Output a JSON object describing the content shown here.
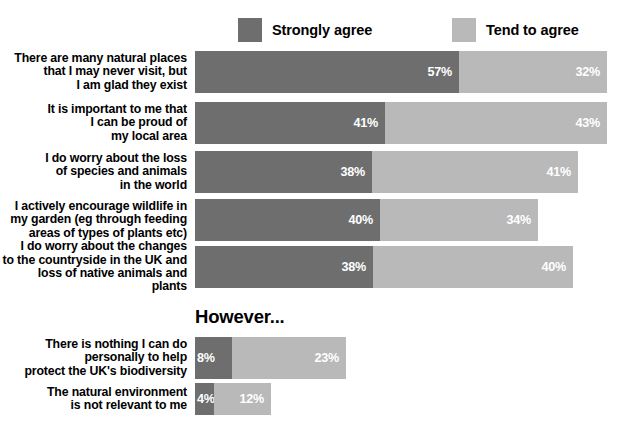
{
  "chart_data": {
    "type": "bar",
    "title": "",
    "subtitle": "",
    "xlabel": "",
    "ylabel": "",
    "orientation": "horizontal",
    "stacked": true,
    "grid": false,
    "legend_position": "top",
    "xlim": [
      0,
      100
    ],
    "unit": "%",
    "colors": {
      "strongly_agree": "#6e6e6e",
      "tend_to_agree": "#b9b9b9",
      "background": "#ffffff",
      "text": "#000000",
      "value_text": "#ffffff"
    },
    "series": [
      {
        "name": "Strongly agree",
        "values": [
          57,
          41,
          38,
          40,
          38,
          8,
          4
        ]
      },
      {
        "name": "Tend to agree",
        "values": [
          32,
          43,
          41,
          34,
          40,
          23,
          12
        ]
      }
    ],
    "categories": [
      "There are many natural places\nthat I may never visit, but\nI am glad they exist",
      "It is important to me that\nI can be proud of\nmy local area",
      "I do worry about the loss\nof species and animals\nin the world",
      "I actively encourage wildlife in\nmy garden (eg through feeding\nareas of types of plants etc)",
      "I do worry about the changes\nto the countryside in the UK and\nloss of native animals and plants",
      "There is nothing I can do\npersonally to help\nprotect the UK's biodiversity",
      "The natural environment\nis not relevant to me"
    ],
    "annotations": [
      {
        "text": "However...",
        "x": 195,
        "y": 306
      }
    ]
  },
  "legend": {
    "items": [
      {
        "label": "Strongly agree",
        "color_key": "strongly_agree",
        "swatch": "dark"
      },
      {
        "label": "Tend to agree",
        "color_key": "tend_to_agree",
        "swatch": "light"
      }
    ]
  },
  "however_heading": "However...",
  "rows": [
    {
      "label": "There are many natural places\nthat I may never visit, but\nI am glad they exist",
      "strongly": 57,
      "tend": 32,
      "strongly_value": "57%",
      "tend_value": "32%",
      "top": 51,
      "height": 42,
      "bar_left": 195,
      "dark_width": 264,
      "light_width": 148
    },
    {
      "label": "It is important to me that\nI can be proud of\nmy local area",
      "strongly": 41,
      "tend": 43,
      "strongly_value": "41%",
      "tend_value": "43%",
      "top": 102,
      "height": 42,
      "bar_left": 195,
      "dark_width": 190,
      "light_width": 222
    },
    {
      "label": "I do worry about the loss\nof species and animals\nin the world",
      "strongly": 38,
      "tend": 41,
      "strongly_value": "38%",
      "tend_value": "41%",
      "top": 151,
      "height": 42,
      "bar_left": 195,
      "dark_width": 177,
      "light_width": 206
    },
    {
      "label": "I actively encourage wildlife in\nmy garden (eg through feeding\nareas of types of plants etc)",
      "strongly": 40,
      "tend": 34,
      "strongly_value": "40%",
      "tend_value": "34%",
      "top": 199,
      "height": 42,
      "bar_left": 195,
      "dark_width": 185,
      "light_width": 158
    },
    {
      "label": "I do worry about the changes\nto the countryside in the UK and\nloss of native animals and plants",
      "strongly": 38,
      "tend": 40,
      "strongly_value": "38%",
      "tend_value": "40%",
      "top": 246,
      "height": 42,
      "bar_left": 195,
      "dark_width": 178,
      "light_width": 200
    },
    {
      "label": "There is nothing I can do\npersonally to help\nprotect the UK's biodiversity",
      "strongly": 8,
      "tend": 23,
      "strongly_value": "8%",
      "tend_value": "23%",
      "top": 337,
      "height": 42,
      "bar_left": 195,
      "dark_width": 37,
      "light_width": 114
    },
    {
      "label": "The natural environment\nis not relevant to me",
      "strongly": 4,
      "tend": 12,
      "strongly_value": "4%",
      "tend_value": "12%",
      "top": 383,
      "height": 32,
      "bar_left": 195,
      "dark_width": 19,
      "light_width": 57
    }
  ]
}
